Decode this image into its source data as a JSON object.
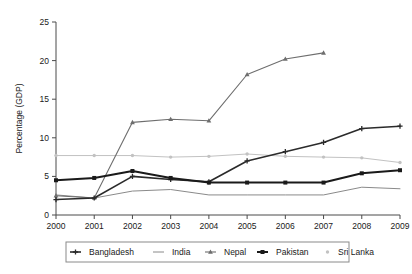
{
  "chart_data": {
    "type": "line",
    "title": "",
    "xlabel": "",
    "ylabel": "Percentage (GDP)",
    "categories": [
      "2000",
      "2001",
      "2002",
      "2003",
      "2004",
      "2005",
      "2006",
      "2007",
      "2008",
      "2009"
    ],
    "x": [
      2000,
      2001,
      2002,
      2003,
      2004,
      2005,
      2006,
      2007,
      2008,
      2009
    ],
    "xlim": [
      2000,
      2009
    ],
    "ylim": [
      0,
      25
    ],
    "yticks": [
      0,
      5,
      10,
      15,
      20,
      25
    ],
    "ytick_labels": [
      "0",
      "5",
      "10",
      "15",
      "20",
      "25"
    ],
    "grid": false,
    "legend_position": "bottom",
    "series": [
      {
        "name": "Bangladesh",
        "color": "#2b2b2b",
        "marker": "plus",
        "line_width": 1.6,
        "values": [
          2.0,
          2.2,
          5.0,
          4.6,
          4.3,
          7.0,
          8.2,
          9.4,
          11.2,
          11.5
        ]
      },
      {
        "name": "India",
        "color": "#8a8a8a",
        "marker": "none",
        "line_width": 1.0,
        "values": [
          2.6,
          2.2,
          3.1,
          3.3,
          2.6,
          2.6,
          2.6,
          2.6,
          3.6,
          3.4
        ]
      },
      {
        "name": "Nepal",
        "color": "#6e6e6e",
        "marker": "triangle",
        "line_width": 1.1,
        "values": [
          2.5,
          2.2,
          12.0,
          12.4,
          12.2,
          18.2,
          20.2,
          21.0,
          null,
          null
        ]
      },
      {
        "name": "Pakistan",
        "color": "#1a1a1a",
        "marker": "square",
        "line_width": 2.0,
        "values": [
          4.5,
          4.8,
          5.7,
          4.8,
          4.2,
          4.2,
          4.2,
          4.2,
          5.4,
          5.8
        ]
      },
      {
        "name": "Sri Lanka",
        "color": "#c2c2c2",
        "marker": "dot",
        "line_width": 1.0,
        "values": [
          7.7,
          7.7,
          7.7,
          7.5,
          7.6,
          7.9,
          7.6,
          7.5,
          7.4,
          6.8
        ]
      }
    ]
  },
  "legend": {
    "entries": [
      {
        "label": "Bangladesh"
      },
      {
        "label": "India"
      },
      {
        "label": "Nepal"
      },
      {
        "label": "Pakistan"
      },
      {
        "label": "Sri Lanka"
      }
    ]
  }
}
